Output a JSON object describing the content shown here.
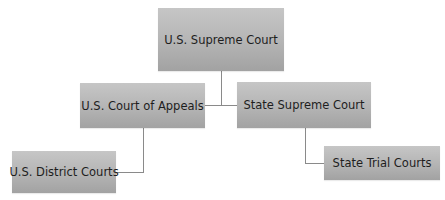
{
  "diagram": {
    "type": "org-chart",
    "nodes": {
      "supreme": {
        "label": "U.S. Supreme Court"
      },
      "appeals": {
        "label": "U.S. Court of Appeals"
      },
      "state_supreme": {
        "label": "State Supreme Court"
      },
      "district": {
        "label": "U.S. District Courts"
      },
      "state_trial": {
        "label": "State Trial Courts"
      }
    },
    "edges": [
      {
        "from": "U.S. Supreme Court",
        "to": "U.S. Court of Appeals"
      },
      {
        "from": "U.S. Supreme Court",
        "to": "State Supreme Court"
      },
      {
        "from": "U.S. Court of Appeals",
        "to": "U.S. District Courts"
      },
      {
        "from": "State Supreme Court",
        "to": "State Trial Courts"
      }
    ],
    "colors": {
      "node_fill_top": "#c6c6c6",
      "node_fill_bottom": "#a2a2a2",
      "node_text": "#1e1e1e",
      "connector": "#8a8a8a",
      "background": "#ffffff"
    }
  }
}
